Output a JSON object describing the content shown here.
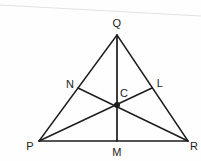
{
  "figure": {
    "kind": "geometry-diagram",
    "background_color": "#fefefe",
    "stroke_color": "#1c1c1c",
    "artifact_color": "#e2e2e2"
  },
  "points": {
    "Q": {
      "label": "Q",
      "x": 117,
      "y": 35,
      "label_x": 117,
      "label_y": 23,
      "role": "apex-vertex"
    },
    "P": {
      "label": "P",
      "x": 39,
      "y": 141,
      "label_x": 30,
      "label_y": 146,
      "role": "bottom-left-vertex"
    },
    "R": {
      "label": "R",
      "x": 188,
      "y": 141,
      "label_x": 194,
      "label_y": 146,
      "role": "bottom-right-vertex"
    },
    "M": {
      "label": "M",
      "x": 117,
      "y": 141,
      "label_x": 117,
      "label_y": 152,
      "role": "midpoint-of-PR"
    },
    "N": {
      "label": "N",
      "x": 78,
      "y": 88,
      "label_x": 70,
      "label_y": 84,
      "role": "midpoint-of-PQ"
    },
    "L": {
      "label": "L",
      "x": 152,
      "y": 88,
      "label_x": 160,
      "label_y": 83,
      "role": "midpoint-of-QR"
    },
    "C": {
      "label": "C",
      "x": 117,
      "y": 105,
      "label_x": 124,
      "label_y": 93,
      "role": "centroid"
    }
  },
  "segments": [
    {
      "name": "side-PQ",
      "from": "P",
      "to": "Q",
      "width": 1.4
    },
    {
      "name": "side-QR",
      "from": "Q",
      "to": "R",
      "width": 1.4
    },
    {
      "name": "side-PR",
      "from": "P",
      "to": "R",
      "width": 1.7
    },
    {
      "name": "median-QM",
      "from": "Q",
      "to": "M",
      "width": 1.7
    },
    {
      "name": "median-PL",
      "from": "P",
      "to": "L",
      "width": 1.4
    },
    {
      "name": "median-RN",
      "from": "R",
      "to": "N",
      "width": 1.4
    }
  ],
  "centroid_marker": {
    "name": "centroid-dot",
    "x": 117,
    "y": 105,
    "radius": 3.0
  },
  "scan_artifact": {
    "name": "scan-line",
    "x1": 0,
    "y1": 5,
    "x2": 201,
    "y2": 16,
    "width": 1.2
  }
}
